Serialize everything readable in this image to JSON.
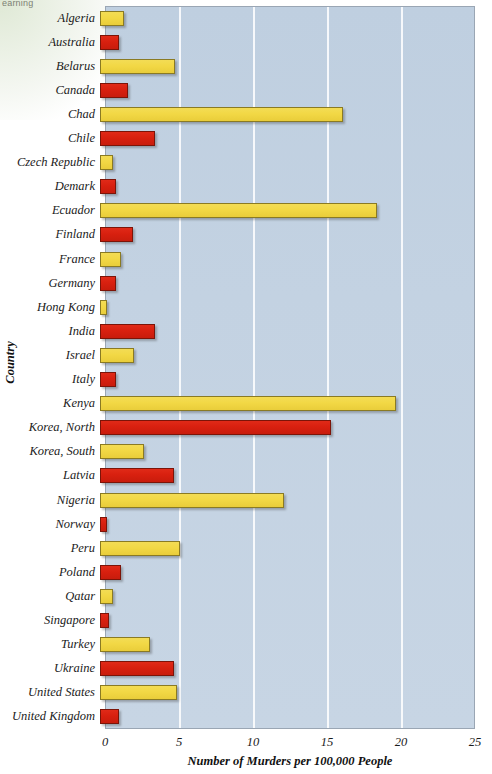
{
  "watermark": "earning",
  "chart_data": {
    "type": "bar",
    "orientation": "horizontal",
    "title": "",
    "xlabel": "Number of Murders per 100,000 People",
    "ylabel": "Country",
    "xlim": [
      0,
      25
    ],
    "xticks": [
      0,
      5,
      10,
      15,
      20,
      25
    ],
    "xtick_labels": [
      "0",
      "5",
      "10",
      "15",
      "20",
      "25"
    ],
    "grid": true,
    "legend": "none",
    "plot_background": "#c3d2e2",
    "colors": {
      "yellow": "#f2d845",
      "red": "#d8200f",
      "plot_bg": "#c3d2e2",
      "grid": "#ffffff",
      "text": "#1b1b1b"
    },
    "categories": [
      "Algeria",
      "Australia",
      "Belarus",
      "Canada",
      "Chad",
      "Chile",
      "Czech Republic",
      "Demark",
      "Ecuador",
      "Finland",
      "France",
      "Germany",
      "Hong Kong",
      "India",
      "Israel",
      "Italy",
      "Kenya",
      "Korea, North",
      "Korea, South",
      "Latvia",
      "Nigeria",
      "Norway",
      "Peru",
      "Poland",
      "Qatar",
      "Singapore",
      "Turkey",
      "Ukraine",
      "United States",
      "United Kingdom"
    ],
    "values": [
      1.6,
      1.3,
      5.1,
      1.9,
      16.4,
      3.7,
      0.9,
      1.1,
      18.7,
      2.2,
      1.4,
      1.1,
      0.5,
      3.7,
      2.3,
      1.1,
      20.0,
      15.6,
      3.0,
      5.0,
      12.4,
      0.5,
      5.4,
      1.4,
      0.9,
      0.6,
      3.4,
      5.0,
      5.2,
      1.3
    ],
    "bar_colors": [
      "yellow",
      "red",
      "yellow",
      "red",
      "yellow",
      "red",
      "yellow",
      "red",
      "yellow",
      "red",
      "yellow",
      "red",
      "yellow",
      "red",
      "yellow",
      "red",
      "yellow",
      "red",
      "yellow",
      "red",
      "yellow",
      "red",
      "yellow",
      "red",
      "yellow",
      "red",
      "yellow",
      "red",
      "yellow",
      "red"
    ]
  }
}
